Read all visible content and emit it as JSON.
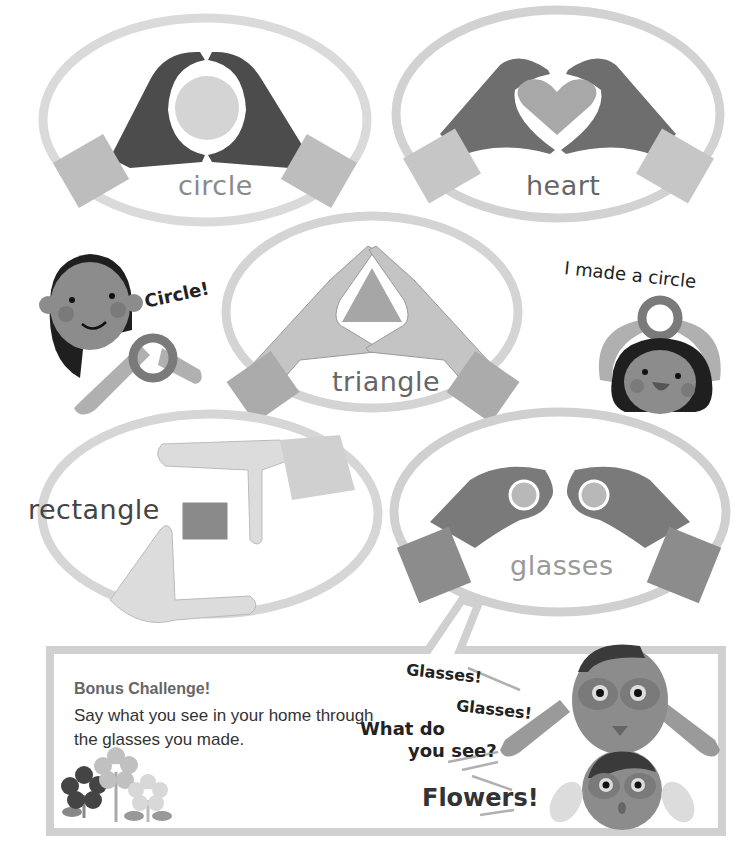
{
  "shapes": [
    {
      "id": "circle",
      "label": "circle"
    },
    {
      "id": "heart",
      "label": "heart"
    },
    {
      "id": "triangle",
      "label": "triangle"
    },
    {
      "id": "rectangle",
      "label": "rectangle"
    },
    {
      "id": "glasses",
      "label": "glasses"
    }
  ],
  "speech": {
    "girl_left": "Circle!",
    "girl_right": "I made a circle",
    "boy_top_1": "Glasses!",
    "boy_top_2": "Glasses!",
    "question": "What do you see?",
    "question_line1": "What do",
    "question_line2": "you see?",
    "answer": "Flowers!"
  },
  "bonus": {
    "title": "Bonus Challenge!",
    "text": "Say what you see in your home through the glasses you made."
  },
  "colors": {
    "oval_ring": "#d6d6d6",
    "dark_hand": "#4a4a4a",
    "mid_hand": "#8e8e8e",
    "light_hand": "#c8c8c8",
    "sleeve": "#bdbdbd",
    "inner_shape": "#cfcfcf",
    "skin": "#8c8c8c",
    "hair": "#1f1f1f",
    "box_border": "#d0d0d0"
  }
}
